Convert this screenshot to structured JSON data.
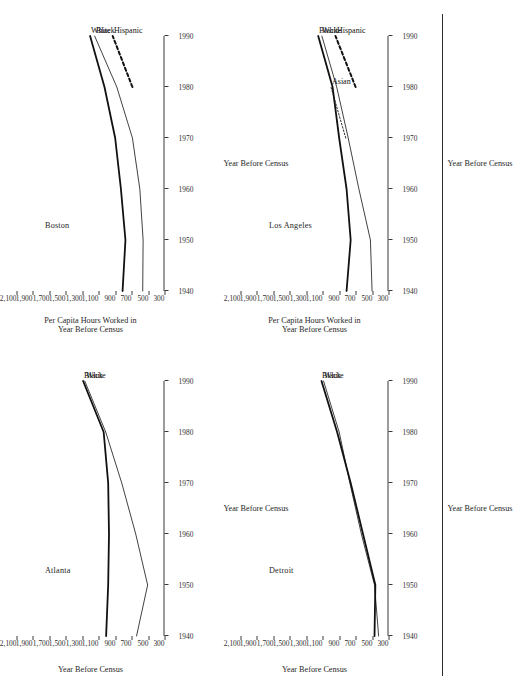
{
  "figure": {
    "orientation": "rotated-90-ccw",
    "page_edge_rule": true,
    "panel_count": 4
  },
  "axis": {
    "xlabel": "Year Before Census",
    "ylabel_line1": "Per Capita Hours Worked in",
    "ylabel_line2": "Year Before Census",
    "xticks": [
      "1940",
      "1950",
      "1960",
      "1970",
      "1980",
      "1990"
    ],
    "yticks": [
      "300",
      "500",
      "700",
      "900",
      "1,100",
      "1,300",
      "1,500",
      "1,700",
      "1,900",
      "2,100"
    ],
    "xlim": [
      1940,
      1990
    ],
    "ylim": [
      300,
      2100
    ]
  },
  "chart_data": [
    {
      "type": "line",
      "title": "Boston",
      "xlabel": "Year Before Census",
      "ylabel": "Per Capita Hours Worked in Year Before Census",
      "xlim": [
        1940,
        1990
      ],
      "ylim": [
        300,
        2100
      ],
      "x": [
        1940,
        1950,
        1960,
        1970,
        1980,
        1990
      ],
      "grid": false,
      "legend": "inline-end-labels",
      "series": [
        {
          "name": "White",
          "style": "thick-solid",
          "values": [
            810,
            775,
            830,
            900,
            1030,
            1205
          ]
        },
        {
          "name": "Black",
          "style": "thin-solid",
          "values": [
            565,
            560,
            600,
            690,
            880,
            1150
          ]
        },
        {
          "name": "Hispanic",
          "style": "thick-dotted",
          "values": [
            null,
            null,
            null,
            null,
            690,
            930
          ]
        }
      ]
    },
    {
      "type": "line",
      "title": "Los Angeles",
      "xlabel": "Year Before Census",
      "ylabel": "Per Capita Hours Worked in Year Before Census",
      "xlim": [
        1940,
        1990
      ],
      "ylim": [
        300,
        2100
      ],
      "x": [
        1940,
        1950,
        1960,
        1970,
        1980,
        1990
      ],
      "grid": false,
      "legend": "inline-end-labels",
      "series": [
        {
          "name": "White",
          "style": "thin-solid",
          "values": [
            500,
            520,
            660,
            790,
            930,
            1110
          ]
        },
        {
          "name": "Black",
          "style": "thick-solid",
          "values": [
            810,
            760,
            810,
            900,
            980,
            1155
          ]
        },
        {
          "name": "Asian",
          "style": "thin-dotted",
          "values": [
            null,
            null,
            null,
            820,
            1000,
            null
          ]
        },
        {
          "name": "Hispanic",
          "style": "thick-dotted",
          "values": [
            null,
            null,
            null,
            null,
            700,
            945
          ]
        }
      ]
    },
    {
      "type": "line",
      "title": "Atlanta",
      "xlabel": "Year Before Census",
      "ylabel": "Year Before Census",
      "xlim": [
        1940,
        1990
      ],
      "ylim": [
        300,
        2100
      ],
      "x": [
        1940,
        1950,
        1960,
        1970,
        1980,
        1990
      ],
      "grid": false,
      "legend": "inline-end-labels",
      "series": [
        {
          "name": "Black",
          "style": "thick-solid",
          "values": [
            1010,
            985,
            975,
            985,
            1040,
            1290
          ]
        },
        {
          "name": "White",
          "style": "thin-solid",
          "values": [
            640,
            505,
            650,
            820,
            1015,
            1270
          ]
        }
      ]
    },
    {
      "type": "line",
      "title": "Detroit",
      "xlabel": "Year Before Census",
      "ylabel": "Year Before Census",
      "xlim": [
        1940,
        1990
      ],
      "ylim": [
        300,
        2100
      ],
      "x": [
        1940,
        1950,
        1960,
        1970,
        1980,
        1990
      ],
      "grid": false,
      "legend": "inline-end-labels",
      "series": [
        {
          "name": "White",
          "style": "thin-solid",
          "values": [
            420,
            470,
            630,
            770,
            900,
            1090
          ]
        },
        {
          "name": "Black",
          "style": "thick-solid",
          "values": [
            470,
            460,
            610,
            760,
            925,
            1115
          ]
        }
      ]
    }
  ]
}
